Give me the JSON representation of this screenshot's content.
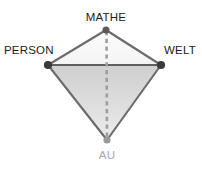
{
  "diagram": {
    "kind": "didactic-triangle",
    "labels": {
      "top": "MATHE",
      "left": "PERSON",
      "right": "WELT",
      "bottom": "AU"
    },
    "vertices": [
      {
        "id": "mathe",
        "label": "MATHE",
        "x": 106,
        "y": 30,
        "dot": true,
        "dot_color": "#555555"
      },
      {
        "id": "person",
        "label": "PERSON",
        "x": 48,
        "y": 65,
        "dot": true,
        "dot_color": "#3a3a3a"
      },
      {
        "id": "welt",
        "label": "WELT",
        "x": 161,
        "y": 65,
        "dot": true,
        "dot_color": "#3a3a3a"
      },
      {
        "id": "au",
        "label": "AU",
        "x": 107,
        "y": 140,
        "dot": true,
        "dot_color": "#9a9a9a"
      }
    ],
    "edges": [
      {
        "from": "person",
        "to": "mathe",
        "style": "solid"
      },
      {
        "from": "mathe",
        "to": "welt",
        "style": "solid"
      },
      {
        "from": "person",
        "to": "welt",
        "style": "solid"
      },
      {
        "from": "person",
        "to": "au",
        "style": "solid"
      },
      {
        "from": "welt",
        "to": "au",
        "style": "solid"
      },
      {
        "from": "mathe",
        "to": "au",
        "style": "dashed"
      }
    ],
    "colors": {
      "background": "#ffffff",
      "upper_fill": "#fafafa",
      "lower_fill_top": "#d0d0d0",
      "lower_fill_bottom": "#ebebeb",
      "edge_stroke": "#6b6b6b",
      "dashed_stroke": "#9e9e9e",
      "label_text": "#1c1c1c",
      "label_text_muted": "#a8a8a8"
    }
  }
}
